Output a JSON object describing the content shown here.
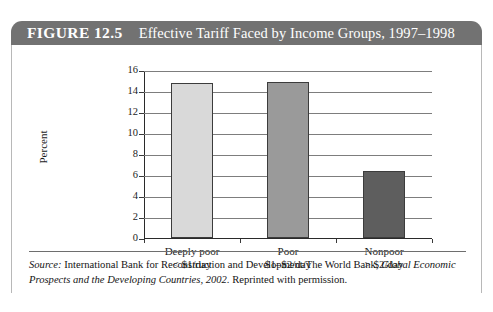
{
  "figure": {
    "number": "FIGURE 12.5",
    "title": "Effective Tariff Faced by Income Groups, 1997–1998"
  },
  "source": {
    "label": "Source:",
    "text_before_italic": " International Bank for Reconstruction and Development/The World Bank, ",
    "italic_text": "Global Economic Prospects and the Developing Countries, 2002.",
    "text_after_italic": " Reprinted with permission."
  },
  "colors": {
    "header_band": "#727272",
    "bar_deeply_poor": "#d9d9d9",
    "bar_poor": "#9a9a9a",
    "bar_nonpoor": "#5e5e5e",
    "bar_outline": "#3c3c3c",
    "gridline": "#7d7d7d",
    "axis": "#2a2a2a",
    "text": "#1c1c1c"
  },
  "chart_data": {
    "type": "bar",
    "title": "Effective Tariff Faced by Income Groups, 1997–1998",
    "xlabel": "",
    "ylabel": "Percent",
    "ylim": [
      0,
      16
    ],
    "yticks": [
      0,
      2,
      4,
      6,
      8,
      10,
      12,
      14,
      16
    ],
    "ytick_labels": [
      "0",
      "2",
      "4",
      "6",
      "8",
      "10",
      "12",
      "14",
      "16"
    ],
    "grid": true,
    "legend": false,
    "categories": [
      "Deeply poor",
      "Poor",
      "Nonpoor"
    ],
    "category_sublabels": [
      "< $1/day",
      "$1–$2/day",
      "> $2/day"
    ],
    "values": [
      14.8,
      14.9,
      6.4
    ],
    "bar_colors": [
      "#d9d9d9",
      "#9a9a9a",
      "#5e5e5e"
    ],
    "series": [
      {
        "name": "Effective tariff (percent)",
        "values": [
          14.8,
          14.9,
          6.4
        ]
      }
    ]
  }
}
